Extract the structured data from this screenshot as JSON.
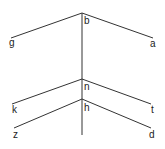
{
  "diagram": {
    "type": "tree",
    "stroke_color": "#333333",
    "trunk": {
      "x": 82,
      "y1": 13,
      "y2": 135
    },
    "nodes": [
      {
        "id": "b",
        "label": "b",
        "x": 82,
        "y": 13,
        "label_x": 84,
        "label_y": 16
      },
      {
        "id": "n",
        "label": "n",
        "x": 82,
        "y": 79,
        "label_x": 84,
        "label_y": 82
      },
      {
        "id": "h",
        "label": "h",
        "x": 82,
        "y": 99,
        "label_x": 84,
        "label_y": 103
      }
    ],
    "branches": [
      {
        "from": "b",
        "to": "g",
        "x1": 82,
        "y1": 13,
        "x2": 11,
        "y2": 38
      },
      {
        "from": "b",
        "to": "a",
        "x1": 82,
        "y1": 13,
        "x2": 153,
        "y2": 38
      },
      {
        "from": "n",
        "to": "k",
        "x1": 82,
        "y1": 79,
        "x2": 12,
        "y2": 104
      },
      {
        "from": "n",
        "to": "t",
        "x1": 82,
        "y1": 79,
        "x2": 151,
        "y2": 104
      },
      {
        "from": "h",
        "to": "z",
        "x1": 82,
        "y1": 99,
        "x2": 14,
        "y2": 128
      },
      {
        "from": "h",
        "to": "d",
        "x1": 82,
        "y1": 99,
        "x2": 151,
        "y2": 128
      }
    ],
    "leaves": [
      {
        "id": "g",
        "label": "g",
        "label_x": 9,
        "label_y": 38
      },
      {
        "id": "a",
        "label": "a",
        "label_x": 150,
        "label_y": 39
      },
      {
        "id": "k",
        "label": "k",
        "label_x": 12,
        "label_y": 105
      },
      {
        "id": "t",
        "label": "t",
        "label_x": 151,
        "label_y": 105
      },
      {
        "id": "z",
        "label": "z",
        "label_x": 13,
        "label_y": 130
      },
      {
        "id": "d",
        "label": "d",
        "label_x": 149,
        "label_y": 130
      }
    ]
  }
}
